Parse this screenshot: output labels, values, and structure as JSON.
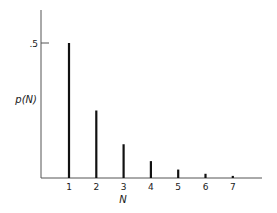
{
  "chart_data": {
    "type": "bar",
    "title": "",
    "xlabel": "N",
    "ylabel": "p(N)",
    "categories": [
      "1",
      "2",
      "3",
      "4",
      "5",
      "6",
      "7"
    ],
    "values": [
      0.5,
      0.25,
      0.125,
      0.0625,
      0.03125,
      0.015625,
      0.0078125
    ],
    "y_ticks": [
      ".5"
    ],
    "ylim": [
      0,
      0.63
    ],
    "grid": false,
    "legend": null,
    "style": "stem/line bars"
  }
}
